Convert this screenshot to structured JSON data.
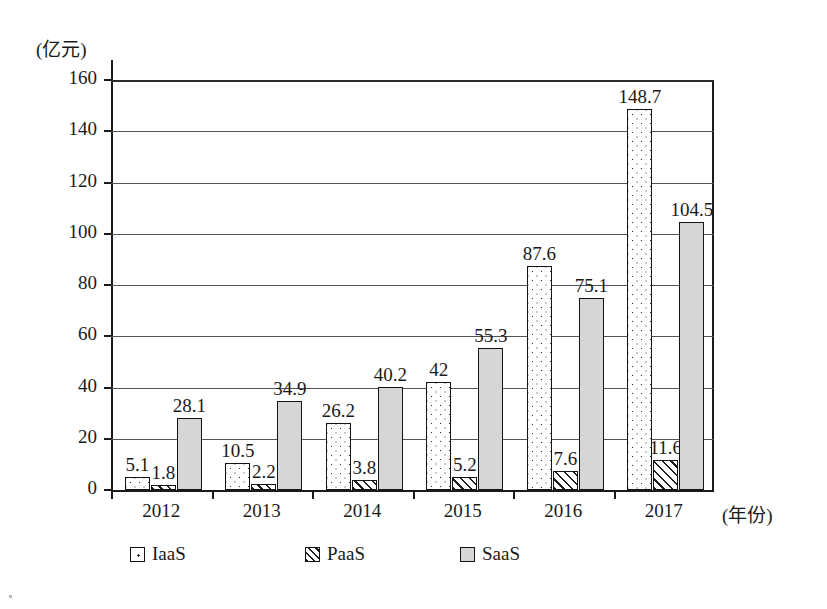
{
  "chart_data": {
    "type": "bar",
    "title": "",
    "xlabel": "(年份)",
    "ylabel": "(亿元)",
    "categories": [
      "2012",
      "2013",
      "2014",
      "2015",
      "2016",
      "2017"
    ],
    "series": [
      {
        "name": "IaaS",
        "pattern": "dotted",
        "values": [
          5.1,
          10.5,
          26.2,
          42,
          87.6,
          148.7
        ],
        "labels": [
          "5.1",
          "10.5",
          "26.2",
          "42",
          "87.6",
          "148.7"
        ]
      },
      {
        "name": "PaaS",
        "pattern": "hatched",
        "values": [
          1.8,
          2.2,
          3.8,
          5.2,
          7.6,
          11.6
        ],
        "labels": [
          "1.8",
          "2.2",
          "3.8",
          "5.2",
          "7.6",
          "11.6"
        ]
      },
      {
        "name": "SaaS",
        "pattern": "solid-gray",
        "values": [
          28.1,
          34.9,
          40.2,
          55.3,
          75.1,
          104.5
        ],
        "labels": [
          "28.1",
          "34.9",
          "40.2",
          "55.3",
          "75.1",
          "104.5"
        ]
      }
    ],
    "yticks": [
      0,
      20,
      40,
      60,
      80,
      100,
      120,
      140,
      160
    ],
    "ytick_labels": [
      "0",
      "20",
      "40",
      "60",
      "80",
      "100",
      "120",
      "140",
      "160"
    ],
    "ylim": [
      0,
      160
    ],
    "grid": true,
    "legend_position": "bottom",
    "colors": {
      "axis": "#1a1a1a",
      "gridline": "#53535a",
      "saas_fill": "#d6d6d6",
      "background": "#ffffff"
    }
  },
  "legend": {
    "items": [
      {
        "label": "IaaS",
        "swatch": "dotted"
      },
      {
        "label": "PaaS",
        "swatch": "hatched"
      },
      {
        "label": "SaaS",
        "swatch": "solid-gray"
      }
    ]
  },
  "axes": {
    "y_unit_label": "(亿元)",
    "x_unit_label": "(年份)"
  }
}
